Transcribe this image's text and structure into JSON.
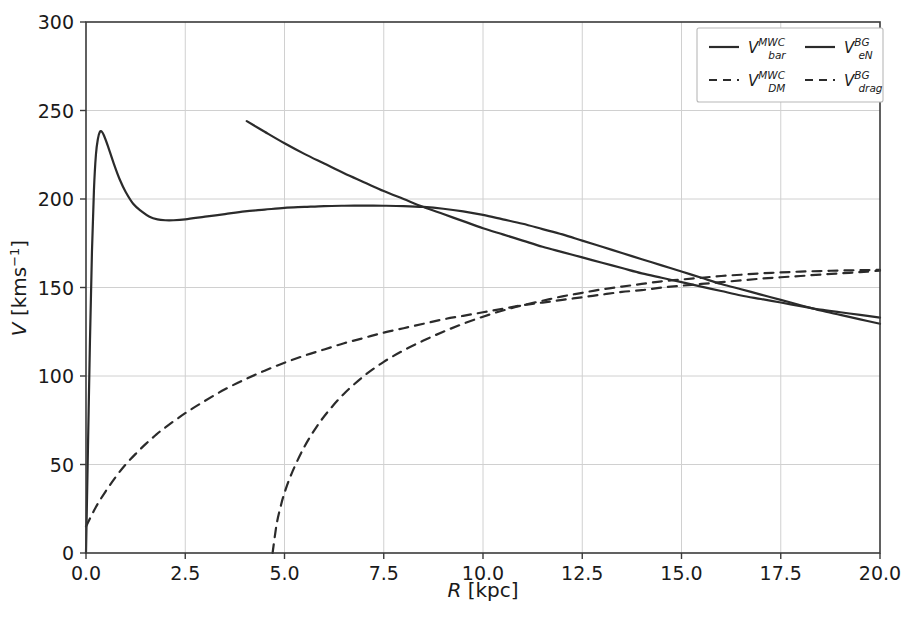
{
  "chart_data": {
    "type": "line",
    "title": "",
    "xlabel": "R [kpc]",
    "ylabel": "V [kms^-1]",
    "xlabel_parts": {
      "symbol": "R",
      "unit": "[kpc]"
    },
    "ylabel_parts": {
      "symbol": "V",
      "unit_pre": "[kms",
      "unit_sup": "−1",
      "unit_post": "]"
    },
    "xlim": [
      0.0,
      20.0
    ],
    "ylim": [
      0,
      300
    ],
    "xticks": [
      0.0,
      2.5,
      5.0,
      7.5,
      10.0,
      12.5,
      15.0,
      17.5,
      20.0
    ],
    "xticklabels": [
      "0.0",
      "2.5",
      "5.0",
      "7.5",
      "10.0",
      "12.5",
      "15.0",
      "17.5",
      "20.0"
    ],
    "yticks": [
      0,
      50,
      100,
      150,
      200,
      250,
      300
    ],
    "yticklabels": [
      "0",
      "50",
      "100",
      "150",
      "200",
      "250",
      "300"
    ],
    "grid": true,
    "legend_position": "upper right",
    "legend_ncol": 2,
    "legend": [
      {
        "symbol": "V",
        "sup": "MWC",
        "sub": "bar",
        "style": "solid"
      },
      {
        "symbol": "V",
        "sup": "BG",
        "sub": "eN",
        "style": "solid"
      },
      {
        "symbol": "V",
        "sup": "MWC",
        "sub": "DM",
        "style": "dashed"
      },
      {
        "symbol": "V",
        "sup": "BG",
        "sub": "drag",
        "style": "dashed"
      }
    ],
    "colors": {
      "line": "#2b2b2b",
      "grid": "#d0d0d0",
      "spine": "#3a3a3a",
      "background": "#ffffff"
    },
    "series": [
      {
        "name": "V_bar^MWC",
        "style": "solid",
        "points": [
          [
            0.0,
            0
          ],
          [
            0.05,
            60
          ],
          [
            0.1,
            120
          ],
          [
            0.15,
            170
          ],
          [
            0.2,
            205
          ],
          [
            0.25,
            225
          ],
          [
            0.3,
            234
          ],
          [
            0.35,
            238
          ],
          [
            0.4,
            238
          ],
          [
            0.45,
            236
          ],
          [
            0.55,
            230
          ],
          [
            0.7,
            220
          ],
          [
            0.85,
            211
          ],
          [
            1.0,
            204
          ],
          [
            1.2,
            197
          ],
          [
            1.4,
            193
          ],
          [
            1.6,
            190
          ],
          [
            1.8,
            188.5
          ],
          [
            2.0,
            188
          ],
          [
            2.2,
            188
          ],
          [
            2.5,
            188.5
          ],
          [
            3.0,
            190
          ],
          [
            3.5,
            191.5
          ],
          [
            4.0,
            193
          ],
          [
            4.5,
            194
          ],
          [
            5.0,
            195
          ],
          [
            5.5,
            195.5
          ],
          [
            6.0,
            196
          ],
          [
            6.5,
            196.2
          ],
          [
            7.0,
            196.3
          ],
          [
            7.5,
            196.2
          ],
          [
            8.0,
            196
          ],
          [
            8.5,
            195.5
          ],
          [
            9.0,
            194.5
          ],
          [
            9.5,
            193
          ],
          [
            10.0,
            191
          ],
          [
            10.5,
            188.5
          ],
          [
            11.0,
            186
          ],
          [
            11.5,
            183
          ],
          [
            12.0,
            180
          ],
          [
            12.5,
            176.5
          ],
          [
            13.0,
            173
          ],
          [
            13.5,
            169.5
          ],
          [
            14.0,
            166
          ],
          [
            14.5,
            162.5
          ],
          [
            15.0,
            159
          ],
          [
            15.5,
            155.5
          ],
          [
            16.0,
            152
          ],
          [
            16.5,
            149
          ],
          [
            17.0,
            146
          ],
          [
            17.5,
            143
          ],
          [
            18.0,
            140
          ],
          [
            18.5,
            137
          ],
          [
            19.0,
            134.5
          ],
          [
            19.5,
            132
          ],
          [
            20.0,
            129.5
          ]
        ]
      },
      {
        "name": "V_eN^BG",
        "style": "solid",
        "points": [
          [
            4.05,
            244
          ],
          [
            4.5,
            238
          ],
          [
            5.0,
            231.5
          ],
          [
            5.5,
            225.5
          ],
          [
            6.0,
            220
          ],
          [
            6.5,
            214.5
          ],
          [
            7.0,
            209.5
          ],
          [
            7.5,
            204.5
          ],
          [
            8.0,
            200
          ],
          [
            8.5,
            195.5
          ],
          [
            9.0,
            191.5
          ],
          [
            9.5,
            187.5
          ],
          [
            10.0,
            183.5
          ],
          [
            10.5,
            180
          ],
          [
            11.0,
            176.5
          ],
          [
            11.5,
            173
          ],
          [
            12.0,
            170
          ],
          [
            12.5,
            167
          ],
          [
            13.0,
            164
          ],
          [
            13.5,
            161
          ],
          [
            14.0,
            158
          ],
          [
            14.5,
            155.5
          ],
          [
            15.0,
            153
          ],
          [
            15.5,
            150.5
          ],
          [
            16.0,
            148
          ],
          [
            16.5,
            145.5
          ],
          [
            17.0,
            143.5
          ],
          [
            17.5,
            141.5
          ],
          [
            18.0,
            139.5
          ],
          [
            18.5,
            137.5
          ],
          [
            19.0,
            136
          ],
          [
            19.5,
            134.5
          ],
          [
            20.0,
            133
          ]
        ]
      },
      {
        "name": "V_DM^MWC",
        "style": "dashed",
        "points": [
          [
            0.0,
            15
          ],
          [
            0.25,
            26
          ],
          [
            0.5,
            35
          ],
          [
            0.75,
            43
          ],
          [
            1.0,
            50
          ],
          [
            1.25,
            56
          ],
          [
            1.5,
            61.5
          ],
          [
            1.75,
            66.5
          ],
          [
            2.0,
            71
          ],
          [
            2.5,
            79
          ],
          [
            3.0,
            86
          ],
          [
            3.5,
            92.5
          ],
          [
            4.0,
            98
          ],
          [
            4.5,
            103
          ],
          [
            5.0,
            107.5
          ],
          [
            5.5,
            111.5
          ],
          [
            6.0,
            115
          ],
          [
            6.5,
            118.5
          ],
          [
            7.0,
            121.5
          ],
          [
            7.5,
            124.5
          ],
          [
            8.0,
            127
          ],
          [
            8.5,
            129.5
          ],
          [
            9.0,
            132
          ],
          [
            9.5,
            134
          ],
          [
            10.0,
            136
          ],
          [
            10.5,
            138
          ],
          [
            11.0,
            140
          ],
          [
            11.5,
            141.5
          ],
          [
            12.0,
            143
          ],
          [
            12.5,
            144.5
          ],
          [
            13.0,
            146
          ],
          [
            13.5,
            147.5
          ],
          [
            14.0,
            148.5
          ],
          [
            14.5,
            150
          ],
          [
            15.0,
            151
          ],
          [
            15.5,
            152
          ],
          [
            16.0,
            153
          ],
          [
            16.5,
            154
          ],
          [
            17.0,
            155
          ],
          [
            17.5,
            155.8
          ],
          [
            18.0,
            156.5
          ],
          [
            18.5,
            157.3
          ],
          [
            19.0,
            158
          ],
          [
            19.5,
            158.7
          ],
          [
            20.0,
            159.5
          ]
        ]
      },
      {
        "name": "V_drag^BG",
        "style": "dashed",
        "points": [
          [
            4.7,
            0
          ],
          [
            4.8,
            16
          ],
          [
            4.9,
            26
          ],
          [
            5.0,
            34
          ],
          [
            5.2,
            46
          ],
          [
            5.5,
            60
          ],
          [
            5.8,
            71
          ],
          [
            6.1,
            80
          ],
          [
            6.5,
            90
          ],
          [
            7.0,
            100
          ],
          [
            7.5,
            108
          ],
          [
            8.0,
            114.5
          ],
          [
            8.5,
            120
          ],
          [
            9.0,
            125
          ],
          [
            9.5,
            129.5
          ],
          [
            10.0,
            133.5
          ],
          [
            10.5,
            137
          ],
          [
            11.0,
            140
          ],
          [
            11.5,
            142.5
          ],
          [
            12.0,
            145
          ],
          [
            12.5,
            147
          ],
          [
            13.0,
            149
          ],
          [
            13.5,
            150.5
          ],
          [
            14.0,
            152
          ],
          [
            14.5,
            153.5
          ],
          [
            15.0,
            154.5
          ],
          [
            15.5,
            155.5
          ],
          [
            16.0,
            156.5
          ],
          [
            16.5,
            157.2
          ],
          [
            17.0,
            158
          ],
          [
            17.5,
            158.5
          ],
          [
            18.0,
            159
          ],
          [
            18.5,
            159.3
          ],
          [
            19.0,
            159.6
          ],
          [
            19.5,
            159.8
          ],
          [
            20.0,
            160
          ]
        ]
      }
    ],
    "annotations": {
      "bar_peak": {
        "x": 0.4,
        "y": 238
      },
      "bar_local_min": {
        "x": 2.1,
        "y": 188
      },
      "bar_local_max": {
        "x": 7.0,
        "y": 196
      },
      "dashed_crossover": {
        "x": 13.7,
        "y": 152
      },
      "solid_crossover": {
        "x": 10.7,
        "y": 184
      },
      "drag_x_intercept": {
        "x": 4.7,
        "y": 0
      },
      "eN_start": {
        "x": 4.05,
        "y": 244
      }
    }
  }
}
